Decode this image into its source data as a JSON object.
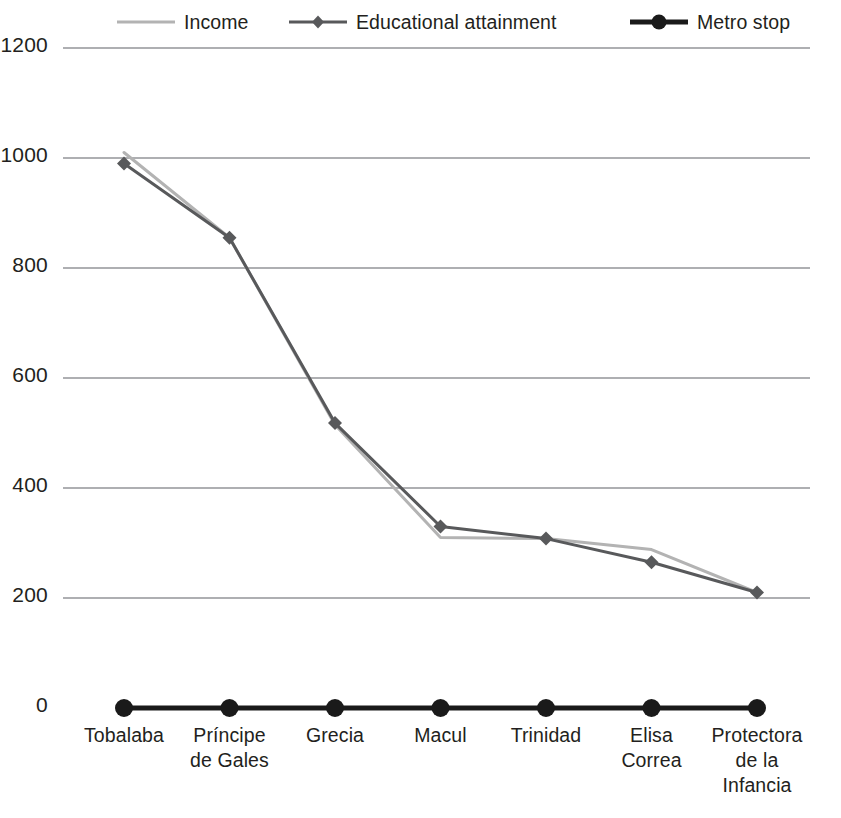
{
  "chart_data": {
    "type": "line",
    "title": "",
    "xlabel": "",
    "ylabel": "",
    "ylim": [
      0,
      1200
    ],
    "yticks": [
      0,
      200,
      400,
      600,
      800,
      1000,
      1200
    ],
    "grid": true,
    "legend_position": "top",
    "categories": [
      "Tobalaba",
      "Príncipe de Gales",
      "Grecia",
      "Macul",
      "Trinidad",
      "Elisa Correa",
      "Protectora de la Infancia"
    ],
    "category_lines": [
      [
        "Tobalaba"
      ],
      [
        "Príncipe",
        "de Gales"
      ],
      [
        "Grecia"
      ],
      [
        "Macul"
      ],
      [
        "Trinidad"
      ],
      [
        "Elisa",
        "Correa"
      ],
      [
        "Protectora",
        "de la",
        "Infancia"
      ]
    ],
    "series": [
      {
        "name": "Income",
        "color": "#b3b3b3",
        "marker": "none",
        "line_width": 3,
        "values": [
          1010,
          855,
          515,
          310,
          308,
          288,
          210
        ]
      },
      {
        "name": "Educational attainment",
        "color": "#58595b",
        "marker": "diamond",
        "line_width": 3,
        "values": [
          990,
          855,
          518,
          330,
          308,
          265,
          210
        ]
      },
      {
        "name": "Metro stop",
        "color": "#1a1a1a",
        "marker": "circle",
        "line_width": 5,
        "values": [
          0,
          0,
          0,
          0,
          0,
          0,
          0
        ]
      }
    ]
  },
  "legend": {
    "items": [
      {
        "label": "Income",
        "color": "#b3b3b3",
        "marker": "none",
        "width": 3
      },
      {
        "label": "Educational attainment",
        "color": "#58595b",
        "marker": "diamond",
        "width": 3
      },
      {
        "label": "Metro stop",
        "color": "#1a1a1a",
        "marker": "circle",
        "width": 5
      }
    ]
  },
  "axis": {
    "y_labels": [
      "1200",
      "1000",
      "800",
      "600",
      "400",
      "200",
      "0"
    ]
  },
  "colors": {
    "background": "#ffffff",
    "grid": "#939598",
    "text": "#231f20",
    "income": "#b3b3b3",
    "education": "#58595b",
    "metro": "#1a1a1a"
  }
}
